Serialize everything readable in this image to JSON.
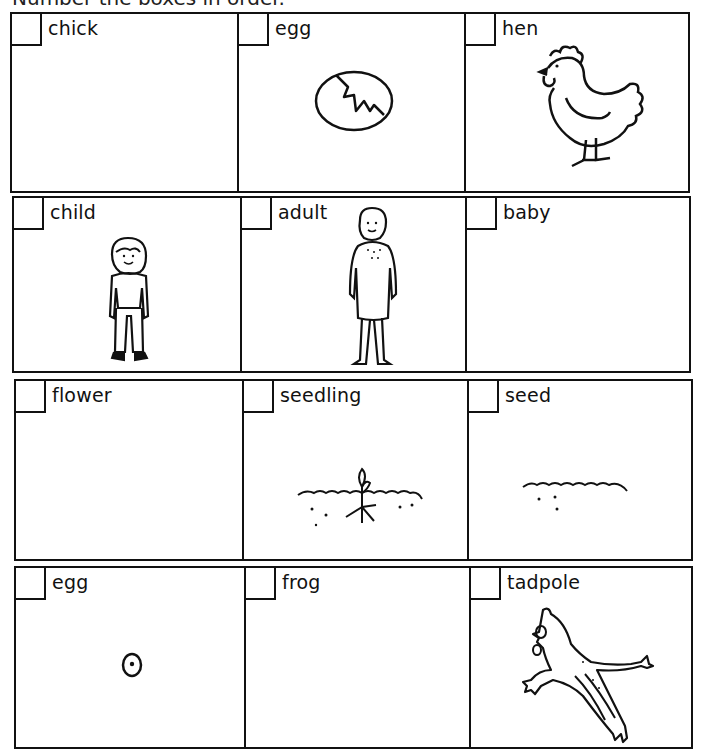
{
  "header": {
    "title": "Number the boxes in order."
  },
  "rows": [
    {
      "cells": [
        {
          "label": "chick",
          "number": "",
          "picture": "none"
        },
        {
          "label": "egg",
          "number": "",
          "picture": "cracked-egg"
        },
        {
          "label": "hen",
          "number": "",
          "picture": "hen"
        }
      ]
    },
    {
      "cells": [
        {
          "label": "child",
          "number": "",
          "picture": "child"
        },
        {
          "label": "adult",
          "number": "",
          "picture": "woman"
        },
        {
          "label": "baby",
          "number": "",
          "picture": "none"
        }
      ]
    },
    {
      "cells": [
        {
          "label": "flower",
          "number": "",
          "picture": "none"
        },
        {
          "label": "seedling",
          "number": "",
          "picture": "seedling-in-soil"
        },
        {
          "label": "seed",
          "number": "",
          "picture": "seeds-in-soil"
        }
      ]
    },
    {
      "cells": [
        {
          "label": "egg",
          "number": "",
          "picture": "frog-egg"
        },
        {
          "label": "frog",
          "number": "",
          "picture": "none"
        },
        {
          "label": "tadpole",
          "number": "",
          "picture": "jumping-frog"
        }
      ]
    }
  ]
}
